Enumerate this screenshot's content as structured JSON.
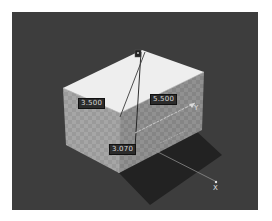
{
  "viewport": {
    "background": "#3d3d3d",
    "object": "box",
    "faces": {
      "top": "#eeeeee",
      "left": "#9c9c9c",
      "right": "#8a8a8a",
      "shadow": "#232323"
    }
  },
  "dimensions": {
    "width_label": "3.500",
    "depth_label": "5.500",
    "height_label": "3.070"
  },
  "axes": {
    "x_label": "X",
    "y_label": "Y",
    "z_label": "Z",
    "x_color": "#e6e6e6",
    "y_color": "#d6d6d6",
    "z_color": "#1a1a1a"
  },
  "gizmo": {
    "icon": "origin-pivot-icon"
  }
}
